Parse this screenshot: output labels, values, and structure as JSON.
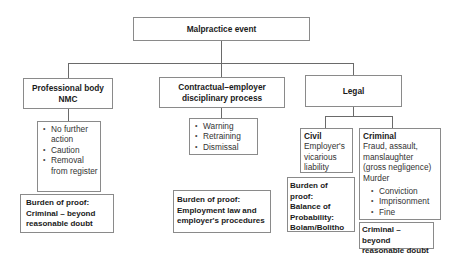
{
  "root": {
    "label": "Malpractice event"
  },
  "branches": {
    "professional": {
      "title_line1": "Professional body",
      "title_line2": "NMC",
      "outcomes": [
        "No further action",
        "Caution",
        "Removal from register"
      ],
      "burden": [
        "Burden of proof:",
        "Criminal – beyond",
        "reasonable doubt"
      ]
    },
    "contractual": {
      "title_line1": "Contractual–employer",
      "title_line2": "disciplinary process",
      "outcomes": [
        "Warning",
        "Retraining",
        "Dismissal"
      ],
      "burden": [
        "Burden of proof:",
        "Employment law and",
        "employer's procedures"
      ]
    },
    "legal": {
      "title": "Legal",
      "civil": {
        "heading": "Civil",
        "description": [
          "Employer's",
          "vicarious",
          "liability"
        ],
        "burden": [
          "Burden of proof:",
          "Balance of",
          "Probability:",
          "Bolam/Bolitho"
        ]
      },
      "criminal": {
        "heading": "Criminal",
        "description": [
          "Fraud, assault,",
          "manslaughter",
          "(gross negligence)",
          "Murder"
        ],
        "outcomes": [
          "Conviction",
          "Imprisonment",
          "Fine"
        ],
        "burden": [
          "Criminal – beyond",
          "reasonable doubt"
        ]
      }
    }
  }
}
